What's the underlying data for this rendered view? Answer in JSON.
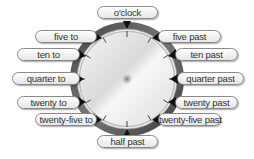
{
  "diagram": {
    "clock": {
      "face_color": "#e8e8e8",
      "ring_color": "#555555",
      "center_dot_color": "#888888",
      "tick_count": 12
    },
    "labels": {
      "oclock": "o'clock",
      "five_past": "five past",
      "ten_past": "ten past",
      "quarter_past": "quarter past",
      "twenty_past": "twenty past",
      "twenty_five_past": "twenty-five past",
      "half_past": "half past",
      "twenty_five_to": "twenty-five to",
      "twenty_to": "twenty to",
      "quarter_to": "quarter to",
      "ten_to": "ten to",
      "five_to": "five to"
    }
  }
}
